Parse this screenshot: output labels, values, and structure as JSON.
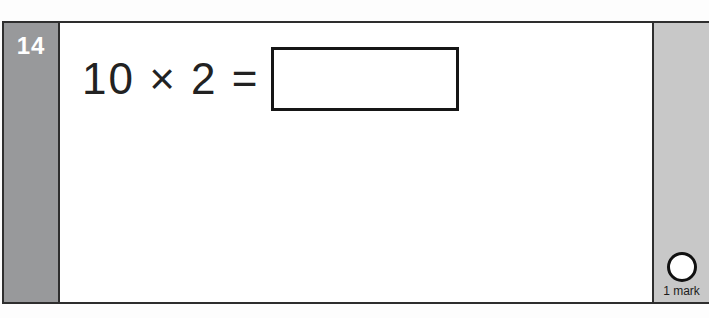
{
  "question": {
    "number": "14",
    "equation": "10 × 2 =",
    "answer_value": "",
    "marks_label": "1 mark"
  },
  "colors": {
    "page_bg": "#fdfdfd",
    "block_bg": "#ffffff",
    "border": "#2e2e2e",
    "number_strip_bg": "#98999b",
    "mark_strip_bg": "#c8c8c8",
    "number_color": "#ffffff",
    "text_color": "#222222",
    "answer_box_border": "#161616",
    "mark_circle_border": "#111111",
    "mark_label_color": "#1c1c1c"
  }
}
